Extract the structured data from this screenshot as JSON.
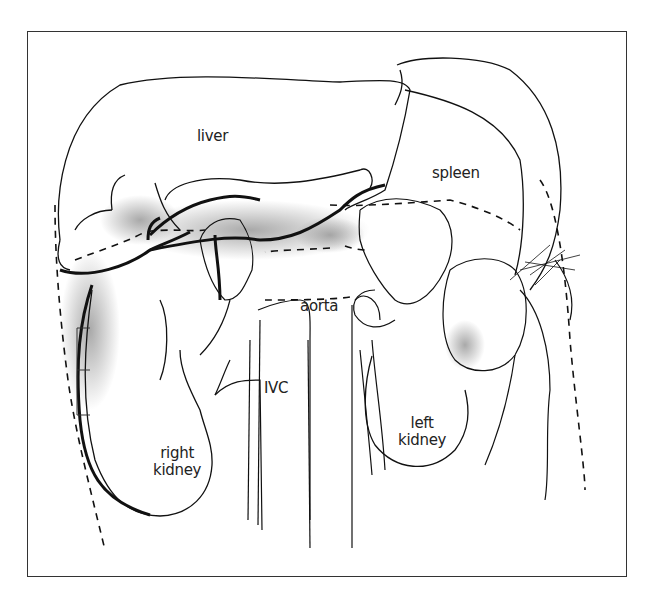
{
  "diagram": {
    "type": "anatomical-illustration",
    "labels": {
      "liver": "liver",
      "spleen": "spleen",
      "aorta": "aorta",
      "ivc": "IVC",
      "left_kidney_line1": "left",
      "left_kidney_line2": "kidney",
      "right_kidney_line1": "right",
      "right_kidney_line2": "kidney"
    },
    "colors": {
      "line": "#111111",
      "shade": "#9a9a9a",
      "background": "#ffffff",
      "frame": "#333333"
    }
  }
}
